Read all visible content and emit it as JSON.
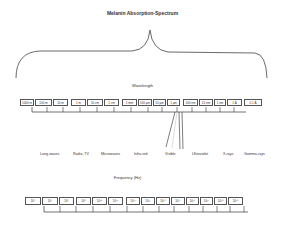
{
  "title": "Melanin Absorption-Spectrum",
  "wavelength": {
    "label": "Wavelength",
    "cells": [
      "1000 m",
      "100 m",
      "10 m",
      "1 m",
      "10 cm",
      "1 cm",
      "1 mm",
      "100 μm",
      "10 μm",
      "1 μm",
      "100 nm",
      "10 nm",
      "1 nm",
      "1 Å",
      "0.1 Å"
    ]
  },
  "bands": [
    "Long-waves",
    "Radio, TV",
    "Microwaves",
    "Infra-red",
    "Visible",
    "Ultraviolet",
    "X-rays",
    "Gamma-rays"
  ],
  "frequency": {
    "label": "Frequency (Hz)",
    "cells": [
      "10⁴",
      "10⁵",
      "10⁶",
      "10⁸",
      "10¹⁰",
      "10¹¹",
      "10¹²",
      "10¹³",
      "10¹⁴",
      "10¹⁵",
      "10¹⁶",
      "10¹⁷",
      "10¹⁸",
      "10¹⁹"
    ]
  }
}
